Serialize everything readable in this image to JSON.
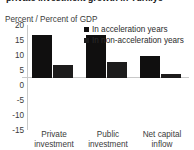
{
  "title": "private investment growth in Türkiye",
  "unit_caption": "Percent / Percent of GDP",
  "legend": [
    {
      "label": "In acceleration years",
      "color": "#100f0f"
    },
    {
      "label": "In non-acceleration years",
      "color": "#1d1c1c"
    }
  ],
  "chart_data": {
    "type": "bar",
    "title": "private investment growth in Türkiye",
    "xlabel": "",
    "ylabel": "Percent / Percent of GDP",
    "categories": [
      "Private investment",
      "Public investment",
      "Net capital inflow"
    ],
    "category_lines": [
      [
        "Private",
        "investment"
      ],
      [
        "Public",
        "investment"
      ],
      [
        "Net capital",
        "inflow"
      ]
    ],
    "series": [
      {
        "name": "In acceleration years",
        "values": [
          14.3,
          14.5,
          7.3
        ],
        "color": "#100f0f"
      },
      {
        "name": "In non-acceleration years",
        "values": [
          4.4,
          5.5,
          1.5
        ],
        "color": "#1d1c1c"
      }
    ],
    "ylim": [
      -15,
      20
    ],
    "yticks": [
      20,
      15,
      10,
      5,
      0,
      -5,
      -10,
      -15
    ],
    "ytick_labels": [
      "20",
      "15",
      "10",
      "5",
      "0",
      "-5",
      "-10",
      "-15"
    ],
    "grid": false,
    "zero_line": true,
    "legend_position": "top-right"
  }
}
